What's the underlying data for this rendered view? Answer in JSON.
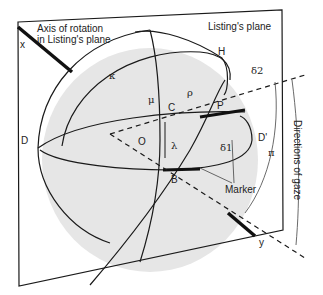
{
  "diagram": {
    "title": "Listing's plane",
    "labels": {
      "axis_of_rotation": "Axis of rotation\nin Listing's plane",
      "axis_line1": "Axis of rotation",
      "axis_line2": "in Listing's plane",
      "listings_plane": "Listing's plane",
      "x": "x",
      "y": "y",
      "H": "H",
      "kappa": "κ",
      "mu": "μ",
      "rho": "ρ",
      "delta2": "δ2",
      "delta1": "δ1",
      "C": "C",
      "P": "P",
      "D": "D",
      "D_prime": "D'",
      "O": "O",
      "lambda": "λ",
      "B": "B",
      "pi": "π",
      "marker": "Marker",
      "directions_of_gaze": "Directions of gaze"
    },
    "colors": {
      "sphere_fill": "#e6e6e6",
      "line": "#1a1a1a",
      "background": "#ffffff"
    }
  }
}
